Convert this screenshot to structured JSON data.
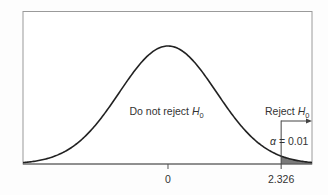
{
  "chart_data": {
    "type": "area",
    "title": "",
    "distribution": "standard-normal",
    "mean": 0,
    "sd": 1,
    "xlim": [
      -2.98,
      2.96
    ],
    "xlabel": "",
    "ylabel": "",
    "grid": false,
    "x_ticks": [
      {
        "value": 0,
        "label": "0"
      },
      {
        "value": 2.326,
        "label": "2.326"
      }
    ],
    "critical_value": 2.326,
    "alpha": 0.01,
    "shaded_region": {
      "from": 2.326,
      "to": 2.96,
      "label": "α = 0.01"
    },
    "annotations": {
      "acceptance_region": {
        "text": "Do not reject ",
        "symbol": "H",
        "subscript": "0"
      },
      "rejection_region": {
        "text": "Reject ",
        "symbol": "H",
        "subscript": "0",
        "arrow": "right"
      },
      "alpha_label": {
        "symbol": "α",
        "text": " = 0.01"
      }
    },
    "colors": {
      "curve": "#222222",
      "shade": "#7a7a7a",
      "frame": "#9a9a9a",
      "axis": "#555555",
      "text": "#333333"
    }
  }
}
